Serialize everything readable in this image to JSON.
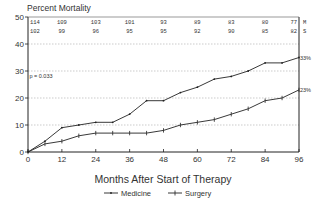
{
  "chart_data": {
    "type": "line",
    "title": "Percent Mortality",
    "xlabel": "Months After Start of Therapy",
    "ylabel": "",
    "xlim": [
      0,
      96
    ],
    "ylim": [
      0,
      50
    ],
    "xticks": [
      0,
      12,
      24,
      36,
      48,
      60,
      72,
      84,
      96
    ],
    "yticks": [
      0,
      10,
      20,
      30,
      40,
      50
    ],
    "grid": "horizontal dotted",
    "legend_position": "bottom-center",
    "series": [
      {
        "name": "Medicine",
        "marker": "dot",
        "x": [
          0,
          6,
          12,
          18,
          24,
          30,
          36,
          42,
          48,
          54,
          60,
          66,
          72,
          78,
          84,
          90,
          96
        ],
        "y": [
          0,
          4,
          9,
          10,
          11,
          11,
          14,
          19,
          19,
          22,
          24,
          27,
          28,
          30,
          33,
          33,
          35
        ],
        "end_label": "33%"
      },
      {
        "name": "Surgery",
        "marker": "plus",
        "x": [
          0,
          6,
          12,
          18,
          24,
          30,
          36,
          42,
          48,
          54,
          60,
          66,
          72,
          78,
          84,
          90,
          96
        ],
        "y": [
          0,
          3,
          4,
          6,
          7,
          7,
          7,
          7,
          8,
          10,
          11,
          12,
          14,
          16,
          19,
          20,
          23
        ],
        "end_label": "23%"
      }
    ],
    "annotations": [
      {
        "text": "p = 0.033",
        "x_month": 0.5,
        "y_value": 28
      }
    ],
    "risk_table": {
      "months": [
        0,
        12,
        24,
        36,
        48,
        60,
        72,
        84,
        96
      ],
      "rows": [
        {
          "label": "M",
          "values": [
            "114",
            "109",
            "103",
            "101",
            "93",
            "89",
            "83",
            "80",
            "77"
          ]
        },
        {
          "label": "S",
          "values": [
            "102",
            "99",
            "96",
            "95",
            "95",
            "92",
            "90",
            "85",
            "82"
          ]
        }
      ]
    }
  }
}
